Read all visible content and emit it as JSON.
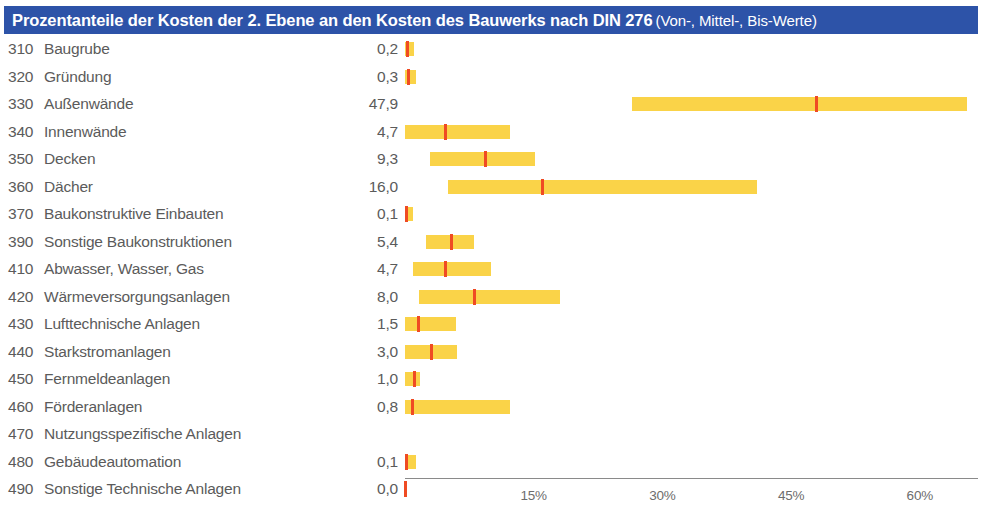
{
  "title": {
    "main": "Prozentanteile der Kosten der 2. Ebene an den Kosten des Bauwerks nach DIN 276",
    "sub": "(Von-, Mittel-, Bis-Werte)"
  },
  "chart_data": {
    "type": "bar",
    "xlabel": "",
    "ylabel": "",
    "xlim": [
      0,
      66
    ],
    "grid": false,
    "legend": null,
    "tick_labels": [
      "15%",
      "30%",
      "45%",
      "60%"
    ],
    "tick_values": [
      15,
      30,
      45,
      60
    ],
    "colors": {
      "range_bar": "#FAD348",
      "mittel_marker": "#EF4B23",
      "title_banner": "#2D53A8",
      "text": "#5B5B5B"
    },
    "series": [
      {
        "name": "Von",
        "values": [
          0.0,
          0.0,
          26.5,
          0.0,
          2.9,
          5.0,
          0.0,
          2.4,
          0.9,
          1.6,
          0.0,
          0.0,
          0.0,
          0.0,
          null,
          0.0,
          0.0
        ]
      },
      {
        "name": "Mittel",
        "values": [
          0.2,
          0.3,
          47.9,
          4.7,
          9.3,
          16.0,
          0.1,
          5.4,
          4.7,
          8.0,
          1.5,
          3.0,
          1.0,
          0.8,
          null,
          0.1,
          0.0
        ]
      },
      {
        "name": "Bis",
        "values": [
          1.0,
          1.3,
          65.5,
          12.2,
          15.2,
          41.0,
          0.9,
          8.0,
          10.0,
          18.1,
          6.0,
          6.1,
          1.7,
          12.2,
          null,
          1.3,
          0.2
        ]
      }
    ],
    "categories": [
      "310 Baugrube",
      "320 Gründung",
      "330 Außenwände",
      "340 Innenwände",
      "350 Decken",
      "360 Dächer",
      "370 Baukonstruktive Einbauten",
      "390 Sonstige Baukonstruktionen",
      "410 Abwasser, Wasser, Gas",
      "420 Wärmeversorgungsanlagen",
      "430 Lufttechnische Anlagen",
      "440 Starkstromanlagen",
      "450 Fernmeldeanlagen",
      "460 Förderanlagen",
      "470 Nutzungsspezifische Anlagen",
      "480 Gebäudeautomation",
      "490 Sonstige Technische Anlagen"
    ]
  },
  "rows": [
    {
      "code": "310",
      "label": "Baugrube",
      "value": "0,2",
      "von": 0.0,
      "mittel": 0.2,
      "bis": 1.0
    },
    {
      "code": "320",
      "label": "Gründung",
      "value": "0,3",
      "von": 0.0,
      "mittel": 0.3,
      "bis": 1.3
    },
    {
      "code": "330",
      "label": "Außenwände",
      "value": "47,9",
      "von": 26.5,
      "mittel": 47.9,
      "bis": 65.5
    },
    {
      "code": "340",
      "label": "Innenwände",
      "value": "4,7",
      "von": 0.0,
      "mittel": 4.7,
      "bis": 12.2
    },
    {
      "code": "350",
      "label": "Decken",
      "value": "9,3",
      "von": 2.9,
      "mittel": 9.3,
      "bis": 15.2
    },
    {
      "code": "360",
      "label": "Dächer",
      "value": "16,0",
      "von": 5.0,
      "mittel": 16.0,
      "bis": 41.0
    },
    {
      "code": "370",
      "label": "Baukonstruktive Einbauten",
      "value": "0,1",
      "von": 0.0,
      "mittel": 0.1,
      "bis": 0.9
    },
    {
      "code": "390",
      "label": "Sonstige Baukonstruktionen",
      "value": "5,4",
      "von": 2.4,
      "mittel": 5.4,
      "bis": 8.0
    },
    {
      "code": "410",
      "label": "Abwasser, Wasser, Gas",
      "value": "4,7",
      "von": 0.9,
      "mittel": 4.7,
      "bis": 10.0
    },
    {
      "code": "420",
      "label": "Wärmeversorgungsanlagen",
      "value": "8,0",
      "von": 1.6,
      "mittel": 8.0,
      "bis": 18.1
    },
    {
      "code": "430",
      "label": "Lufttechnische Anlagen",
      "value": "1,5",
      "von": 0.0,
      "mittel": 1.5,
      "bis": 6.0
    },
    {
      "code": "440",
      "label": "Starkstromanlagen",
      "value": "3,0",
      "von": 0.0,
      "mittel": 3.0,
      "bis": 6.1
    },
    {
      "code": "450",
      "label": "Fernmeldeanlagen",
      "value": "1,0",
      "von": 0.0,
      "mittel": 1.0,
      "bis": 1.7
    },
    {
      "code": "460",
      "label": "Förderanlagen",
      "value": "0,8",
      "von": 0.0,
      "mittel": 0.8,
      "bis": 12.2
    },
    {
      "code": "470",
      "label": "Nutzungsspezifische Anlagen",
      "value": "",
      "von": null,
      "mittel": null,
      "bis": null
    },
    {
      "code": "480",
      "label": "Gebäudeautomation",
      "value": "0,1",
      "von": 0.0,
      "mittel": 0.1,
      "bis": 1.3
    },
    {
      "code": "490",
      "label": "Sonstige Technische Anlagen",
      "value": "0,0",
      "von": 0.0,
      "mittel": 0.0,
      "bis": 0.2
    }
  ],
  "axis": {
    "ticks": [
      {
        "label": "15%",
        "value": 15
      },
      {
        "label": "30%",
        "value": 30
      },
      {
        "label": "45%",
        "value": 45
      },
      {
        "label": "60%",
        "value": 60
      }
    ]
  }
}
